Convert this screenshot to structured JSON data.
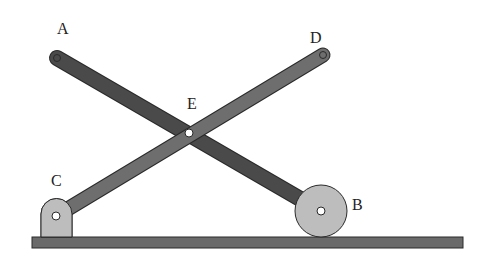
{
  "diagram": {
    "type": "mechanism",
    "labels": {
      "A": "A",
      "B": "B",
      "C": "C",
      "D": "D",
      "E": "E"
    },
    "colors": {
      "bar_AB": "#4a4a4a",
      "bar_CD": "#6e6e6e",
      "ground": "#6a6a6a",
      "roller": "#bdbdbd",
      "bracket": "#bdbdbd",
      "outline": "#2a2a2a",
      "pin": "#ffffff"
    },
    "points": {
      "A": [
        57,
        58
      ],
      "B": [
        321,
        211
      ],
      "C": [
        56,
        216
      ],
      "D": [
        323,
        55
      ],
      "E": [
        189,
        133
      ]
    }
  }
}
